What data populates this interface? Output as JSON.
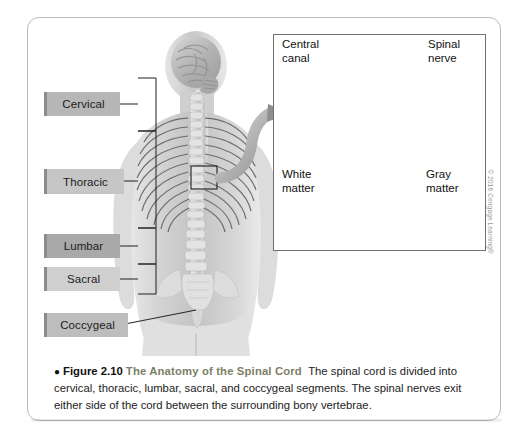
{
  "figure": {
    "caption": {
      "bullet": "●",
      "number": "Figure 2.10",
      "title": "The Anatomy of the Spinal Cord",
      "body": "The spinal cord is divided into cervical, thoracic, lumbar, sacral, and coccygeal segments. The spinal nerves exit either side of the cord between the surrounding bony vertebrae."
    },
    "copyright": "© 2016 Cengage Learning®"
  },
  "segments": [
    {
      "label": "Cervical",
      "fill": "#b6b6b6"
    },
    {
      "label": "Thoracic",
      "fill": "#c6c6c6"
    },
    {
      "label": "Lumbar",
      "fill": "#a9a9a9"
    },
    {
      "label": "Sacral",
      "fill": "#cfcfcf"
    },
    {
      "label": "Coccygeal",
      "fill": "#bdbdbd"
    }
  ],
  "inset": {
    "labels": [
      {
        "name": "central-canal",
        "text": "Central\ncanal"
      },
      {
        "name": "spinal-nerve",
        "text": "Spinal\nnerve"
      },
      {
        "name": "white-matter",
        "text": "White\nmatter"
      },
      {
        "name": "gray-matter",
        "text": "Gray\nmatter"
      }
    ]
  },
  "colors": {
    "card_border": "#b9b9b9",
    "inset_border": "#6f6f6f",
    "leader_line": "#2a2a2a",
    "title_olive": "#7d7f66",
    "body_gray": "#9a9a9a"
  }
}
